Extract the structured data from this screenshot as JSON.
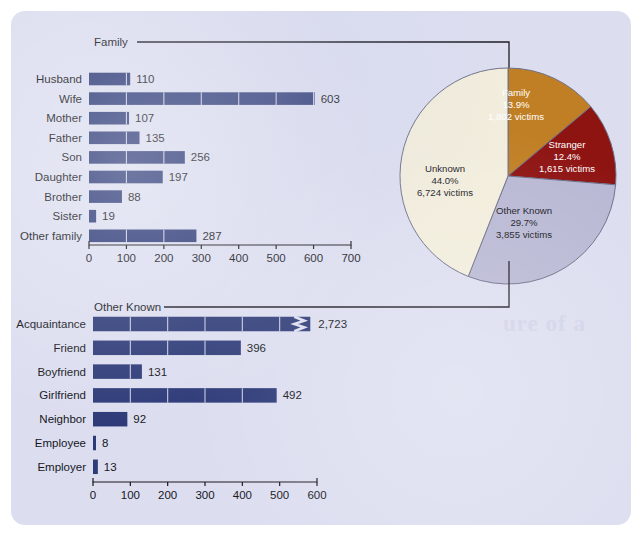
{
  "colors": {
    "card_bg": "#dcdef0",
    "bar": "#2e3b78",
    "family_wedge": "#c07f24",
    "stranger_wedge": "#8e1412",
    "other_known_wedge": "#b9b8d4",
    "unknown_wedge": "#f2eddc",
    "text": "#16161c"
  },
  "connectors": {
    "family_label": "Family",
    "other_known_label": "Other Known"
  },
  "chart_data": [
    {
      "type": "bar",
      "orientation": "horizontal",
      "name": "family-bar-chart",
      "title": "Family",
      "categories": [
        "Husband",
        "Wife",
        "Mother",
        "Father",
        "Son",
        "Daughter",
        "Brother",
        "Sister",
        "Other family"
      ],
      "values": [
        110,
        603,
        107,
        135,
        256,
        197,
        88,
        19,
        287
      ],
      "value_labels": [
        "110",
        "603",
        "107",
        "135",
        "256",
        "197",
        "88",
        "19",
        "287"
      ],
      "xlabel": "",
      "ylabel": "",
      "xlim": [
        0,
        700
      ],
      "ticks": [
        0,
        100,
        200,
        300,
        400,
        500,
        600,
        700
      ],
      "tick_labels": [
        "0",
        "100",
        "200",
        "300",
        "400",
        "500",
        "600",
        "700"
      ],
      "grid": false,
      "broken_bars": []
    },
    {
      "type": "bar",
      "orientation": "horizontal",
      "name": "other-known-bar-chart",
      "title": "Other Known",
      "categories": [
        "Acquaintance",
        "Friend",
        "Boyfriend",
        "Girlfriend",
        "Neighbor",
        "Employee",
        "Employer"
      ],
      "values": [
        2723,
        396,
        131,
        492,
        92,
        8,
        13
      ],
      "value_labels": [
        "2,723",
        "396",
        "131",
        "492",
        "92",
        "8",
        "13"
      ],
      "xlabel": "",
      "ylabel": "",
      "xlim": [
        0,
        600
      ],
      "ticks": [
        0,
        100,
        200,
        300,
        400,
        500,
        600
      ],
      "tick_labels": [
        "0",
        "100",
        "200",
        "300",
        "400",
        "500",
        "600"
      ],
      "grid": false,
      "broken_bars": [
        "Acquaintance"
      ]
    },
    {
      "type": "pie",
      "name": "relationship-pie-chart",
      "title": "",
      "slices": [
        {
          "label": "Family",
          "percent": 13.9,
          "victims": "1,802",
          "victims_text": "1,802 victims",
          "percent_text": "13.9%",
          "color": "#c07f24",
          "text_color": "light"
        },
        {
          "label": "Stranger",
          "percent": 12.4,
          "victims": "1,615",
          "victims_text": "1,615 victims",
          "percent_text": "12.4%",
          "color": "#8e1412",
          "text_color": "light"
        },
        {
          "label": "Other Known",
          "percent": 29.7,
          "victims": "3,855",
          "victims_text": "3,855 victims",
          "percent_text": "29.7%",
          "color": "#b9b8d4",
          "text_color": "dark"
        },
        {
          "label": "Unknown",
          "percent": 44.0,
          "victims": "6,724",
          "victims_text": "6,724 victims",
          "percent_text": "44.0%",
          "color": "#f2eddc",
          "text_color": "dark"
        }
      ],
      "legend_position": "inside-slices"
    }
  ],
  "ghost_text": {
    "line1": "ure of a"
  }
}
